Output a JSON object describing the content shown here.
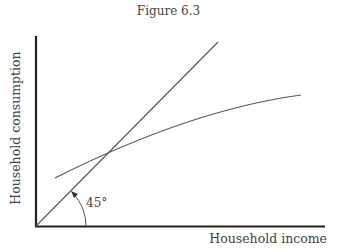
{
  "figure": {
    "title": "Figure 6.3",
    "y_axis_label": "Household consumption",
    "x_axis_label": "Household income",
    "angle_label": "45°"
  },
  "diagram": {
    "elements": [
      {
        "id": "y-axis",
        "type": "axis",
        "label": "Household consumption"
      },
      {
        "id": "x-axis",
        "type": "axis",
        "label": "Household income"
      },
      {
        "id": "45-degree-line",
        "type": "line",
        "description": "Line from origin at 45 degrees (consumption = income)"
      },
      {
        "id": "consumption-function",
        "type": "curve",
        "description": "Concave consumption curve crossing the 45-degree line"
      },
      {
        "id": "angle-arc",
        "type": "arc",
        "label": "45°"
      }
    ],
    "colors": {
      "axis": "#222222",
      "lines": "#555555",
      "text": "#444444"
    }
  }
}
